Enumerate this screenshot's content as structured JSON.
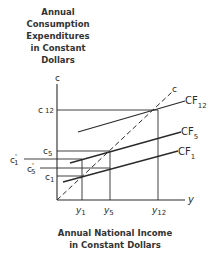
{
  "y_axis_title": [
    "Annual",
    "Consumption",
    "Expenditures",
    "in Constant",
    "Dollars"
  ],
  "x_axis_title": [
    "Annual National Income",
    "in Constant Dollars"
  ],
  "axis_symbols": {
    "y_axis": "c",
    "x_axis": "y",
    "diagonal": "c"
  },
  "y_ticks": [
    {
      "label": "c",
      "sub": "12",
      "prime": ""
    },
    {
      "label": "c",
      "sub": "5",
      "prime": ""
    },
    {
      "label": "c",
      "sub": "1",
      "prime": "'"
    },
    {
      "label": "c",
      "sub": "5",
      "prime": "'"
    },
    {
      "label": "c",
      "sub": "1",
      "prime": ""
    }
  ],
  "x_ticks": [
    {
      "label": "y",
      "sub": "1"
    },
    {
      "label": "y",
      "sub": "5"
    },
    {
      "label": "y",
      "sub": "12"
    }
  ],
  "curves": [
    {
      "label": "CF",
      "sub": "12"
    },
    {
      "label": "CF",
      "sub": "5"
    },
    {
      "label": "CF",
      "sub": "1"
    }
  ]
}
